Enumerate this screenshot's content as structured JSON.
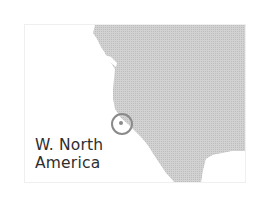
{
  "map": {
    "region_label_line1": "W. North",
    "region_label_line2": "America",
    "land_color": "#cbcbcb",
    "water_color": "#ffffff",
    "marker": {
      "type": "circle",
      "color": "#8a8a8a",
      "cx": 121,
      "cy": 123,
      "r": 10
    }
  }
}
